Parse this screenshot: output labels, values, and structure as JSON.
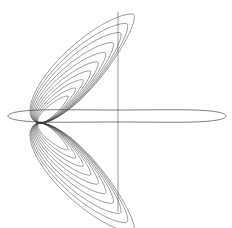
{
  "figure": {
    "width": 232,
    "height": 228,
    "background": "#ffffff",
    "stroke_color": "#3a3a3a",
    "pinch_point": [
      40,
      123
    ],
    "lobe_count": 10,
    "lobes": {
      "scales": [
        0.3,
        0.38,
        0.46,
        0.54,
        0.62,
        0.7,
        0.78,
        0.86,
        0.93,
        1.0
      ],
      "outer_tip": [
        132,
        14
      ],
      "description": "nested lobes emanating from pinch point, mirrored above and below"
    },
    "band": {
      "x_min": 8,
      "x_max": 226,
      "y_center": 116,
      "half_height": 6,
      "description": "thin horizontal twisted loop"
    },
    "vertical_line": {
      "x": 118,
      "y_top": 12,
      "y_bottom": 212
    }
  }
}
